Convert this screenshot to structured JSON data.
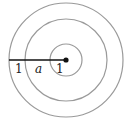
{
  "diagram": {
    "type": "concentric-circles",
    "center": {
      "x": 66,
      "y": 60
    },
    "circles": [
      {
        "name": "outer",
        "r": 57
      },
      {
        "name": "middle",
        "r": 41
      },
      {
        "name": "inner",
        "r": 16
      }
    ],
    "stroke_color": "#9a9a9a",
    "radius_line_color": "#111111",
    "labels": [
      {
        "text": "1",
        "x": 17,
        "y": 73,
        "italic": false
      },
      {
        "text": "a",
        "x": 36,
        "y": 73,
        "italic": true
      },
      {
        "text": "1",
        "x": 56,
        "y": 73,
        "italic": false
      }
    ]
  }
}
